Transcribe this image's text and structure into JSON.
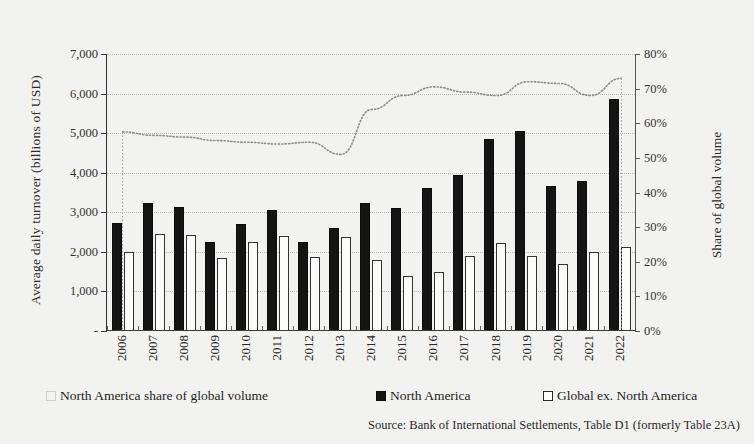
{
  "chart_data": {
    "type": "bar",
    "title": "",
    "categories": [
      "2006",
      "2007",
      "2008",
      "2009",
      "2010",
      "2011",
      "2012",
      "2013",
      "2014",
      "2015",
      "2016",
      "2017",
      "2018",
      "2019",
      "2020",
      "2021",
      "2022"
    ],
    "xlabel": "",
    "ylabel": "Average daily  turnover (billions of USD)",
    "y2label": "Share of global volume",
    "ylim": [
      0,
      7000
    ],
    "y2lim": [
      0,
      80
    ],
    "yticks": [
      "-",
      "1,000",
      "2,000",
      "3,000",
      "4,000",
      "5,000",
      "6,000",
      "7,000"
    ],
    "y2ticks": [
      "0%",
      "10%",
      "20%",
      "30%",
      "40%",
      "50%",
      "60%",
      "70%",
      "80%"
    ],
    "grid": true,
    "legend_position": "bottom",
    "series": [
      {
        "name": "North America share of global volume",
        "type": "line",
        "axis": "right",
        "style": "dotted",
        "unit": "%",
        "values": [
          57.5,
          56.5,
          56.0,
          55.0,
          54.5,
          54.0,
          54.5,
          51.0,
          64.0,
          68.0,
          70.5,
          69.0,
          68.0,
          72.0,
          71.5,
          68.0,
          73.0
        ]
      },
      {
        "name": "North America",
        "type": "bar",
        "axis": "left",
        "fill": "#141414",
        "values": [
          2720,
          3230,
          3140,
          2240,
          2700,
          3060,
          2260,
          2600,
          3230,
          3120,
          3610,
          3930,
          4840,
          5060,
          3660,
          3800,
          5860
        ]
      },
      {
        "name": "Global ex. North America",
        "type": "bar",
        "axis": "left",
        "fill": "#ffffff",
        "values": [
          2000,
          2460,
          2420,
          1840,
          2260,
          2400,
          1880,
          2380,
          1800,
          1400,
          1490,
          1900,
          2230,
          1900,
          1700,
          1990,
          2130
        ]
      }
    ]
  },
  "legend": {
    "items": [
      {
        "label": "North America share of global volume",
        "swatch": "share-swatch"
      },
      {
        "label": "North America",
        "swatch": "dark-swatch"
      },
      {
        "label": "Global ex. North America",
        "swatch": "outline-swatch"
      }
    ]
  },
  "source": {
    "text": "Source: Bank of International Settlements, Table D1 (formerly Table 23A)"
  }
}
